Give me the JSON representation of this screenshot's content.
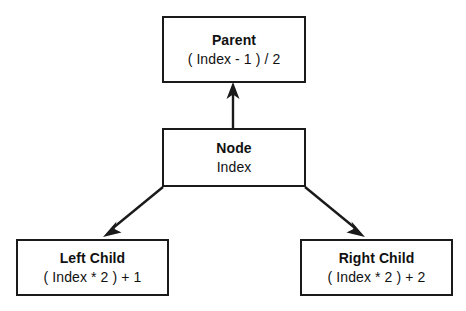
{
  "diagram": {
    "background_color": "#ffffff",
    "stroke_color": "#1a1a1a",
    "nodes": [
      {
        "id": "parent",
        "title": "Parent",
        "formula": "( Index  - 1 ) / 2"
      },
      {
        "id": "node",
        "title": "Node",
        "formula": "Index"
      },
      {
        "id": "left_child",
        "title": "Left Child",
        "formula": "( Index * 2 ) + 1"
      },
      {
        "id": "right_child",
        "title": "Right Child",
        "formula": "( Index * 2 ) + 2"
      }
    ],
    "edges": [
      {
        "id": "node-to-parent",
        "from": "node",
        "to": "parent",
        "direction": "up"
      },
      {
        "id": "node-to-left-child",
        "from": "node",
        "to": "left_child",
        "direction": "down-left"
      },
      {
        "id": "node-to-right-child",
        "from": "node",
        "to": "right_child",
        "direction": "down-right"
      }
    ]
  }
}
